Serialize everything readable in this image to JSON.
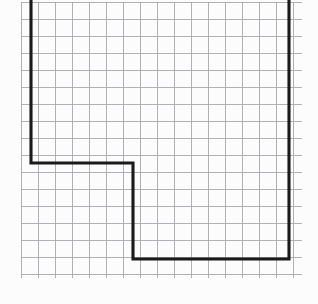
{
  "figure": {
    "kind": "graph-paper-diagram",
    "canvas": {
      "width": 318,
      "height": 304
    },
    "background_color": "#fcfcfc",
    "grid": {
      "cell_size": 17,
      "line_color": "#a9a9ad",
      "line_width": 0.9,
      "x_start": 21,
      "x_end": 302,
      "y_start": 2,
      "y_end": 278,
      "vertical_count": 17,
      "horizontal_count": 17,
      "visible": true
    },
    "shape": {
      "name": "l-shape-outline",
      "stroke_color": "#1a1a1a",
      "stroke_width": 3.1,
      "fill": "none",
      "vertices": [
        {
          "x": 31,
          "y": 0
        },
        {
          "x": 31,
          "y": 163
        },
        {
          "x": 133,
          "y": 163
        },
        {
          "x": 133,
          "y": 259
        },
        {
          "x": 289,
          "y": 259
        },
        {
          "x": 289,
          "y": 0
        }
      ],
      "open_at_top": true,
      "grid_units": {
        "left_vertical_height": 9.6,
        "upper_horizontal_width": 6,
        "inner_vertical_height": 5.6,
        "bottom_horizontal_width": 9.2,
        "right_vertical_height": 15.2
      }
    }
  }
}
